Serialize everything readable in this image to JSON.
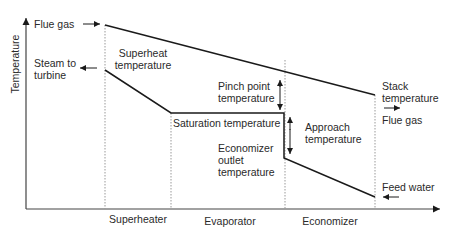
{
  "diagram": {
    "y_axis_label": "Temperature",
    "labels": {
      "flue_gas_in": "Flue gas",
      "steam_to_turbine": "Steam to turbine",
      "superheat_temperature": "Superheat temperature",
      "pinch_point_temperature": "Pinch point temperature",
      "saturation_temperature": "Saturation temperature",
      "approach_temperature": "Approach temperature",
      "economizer_outlet_temperature": "Economizer outlet temperature",
      "stack_temperature": "Stack temperature",
      "flue_gas_out": "Flue gas",
      "feed_water": "Feed water"
    },
    "sections": [
      "Superheater",
      "Evaporator",
      "Economizer"
    ],
    "colors": {
      "line": "#1a1a1a",
      "divider": "#999999"
    }
  }
}
